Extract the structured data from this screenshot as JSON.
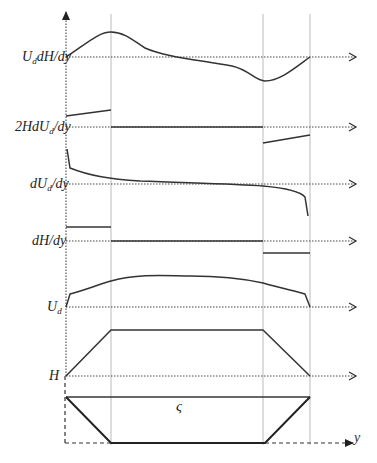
{
  "diagram": {
    "type": "profile-stack",
    "x_axis_label": "y",
    "rows": [
      {
        "id": "UdHdy",
        "label_main": "U",
        "label_sub": "d",
        "label_tail": "dH/dy",
        "baseline_y": 57
      },
      {
        "id": "2HdUddy",
        "label_main": "2HdU",
        "label_sub": "d",
        "label_tail": "/dy",
        "baseline_y": 127
      },
      {
        "id": "dUddy",
        "label_main": "dU",
        "label_sub": "d",
        "label_tail": "/dy",
        "baseline_y": 184
      },
      {
        "id": "dHdy",
        "label_main": "dH/dy",
        "label_sub": "",
        "label_tail": "",
        "baseline_y": 241
      },
      {
        "id": "Ud",
        "label_main": "U",
        "label_sub": "d",
        "label_tail": "",
        "baseline_y": 307
      },
      {
        "id": "H",
        "label_main": "H",
        "label_sub": "",
        "label_tail": "",
        "baseline_y": 376
      }
    ],
    "cross_section": {
      "water_surface_symbol": "ς",
      "shape": "trapezoid"
    },
    "vertical_guides_x": [
      66,
      111,
      263,
      310
    ],
    "colors": {
      "line": "#333333",
      "guide": "#999999",
      "dotted": "#444444"
    }
  }
}
